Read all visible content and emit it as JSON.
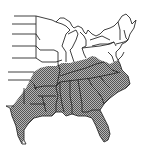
{
  "map": {
    "region": "Eastern United States",
    "type": "range distribution map",
    "shaded_area_description": "Southeastern and south-central states",
    "colors": {
      "background": "#ffffff",
      "outline": "#2a2a2a",
      "range_fill": "#9a9a9a",
      "range_hatch": "#5a5a5a"
    }
  }
}
